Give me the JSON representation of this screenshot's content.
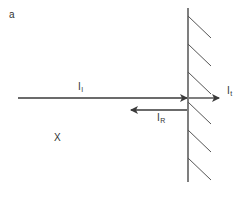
{
  "figure": {
    "panel_label": "a",
    "region_label": "X",
    "incident": {
      "label": "I",
      "subscript": "I"
    },
    "reflected": {
      "label": "I",
      "subscript": "R"
    },
    "transmitted": {
      "label": "I",
      "subscript": "t"
    }
  },
  "colors": {
    "line": "#3a3a3a",
    "hatch": "#555555",
    "text": "#333333"
  }
}
